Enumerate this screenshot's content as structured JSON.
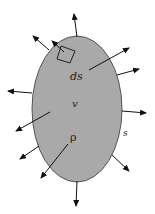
{
  "diagram": {
    "colors": {
      "body_fill": "#a9a9a9",
      "body_stroke": "#555555",
      "arrow": "#111111",
      "background": "#ffffff"
    },
    "labels": {
      "surface_element": "ds",
      "volume": "v",
      "density": "ρ",
      "surface": "s"
    },
    "arrows": [
      {
        "x1": 77,
        "y1": 37,
        "x2": 74,
        "y2": 14
      },
      {
        "x1": 49,
        "y1": 50,
        "x2": 33,
        "y2": 36
      },
      {
        "x1": 64,
        "y1": 52,
        "x2": 52,
        "y2": 41
      },
      {
        "x1": 89,
        "y1": 70,
        "x2": 129,
        "y2": 48
      },
      {
        "x1": 117,
        "y1": 75,
        "x2": 139,
        "y2": 69
      },
      {
        "x1": 32,
        "y1": 93,
        "x2": 8,
        "y2": 91
      },
      {
        "x1": 122,
        "y1": 111,
        "x2": 146,
        "y2": 113
      },
      {
        "x1": 50,
        "y1": 112,
        "x2": 16,
        "y2": 131
      },
      {
        "x1": 39,
        "y1": 146,
        "x2": 20,
        "y2": 159
      },
      {
        "x1": 68,
        "y1": 144,
        "x2": 41,
        "y2": 178
      },
      {
        "x1": 112,
        "y1": 155,
        "x2": 129,
        "y2": 171
      },
      {
        "x1": 77,
        "y1": 181,
        "x2": 76,
        "y2": 206
      }
    ]
  }
}
